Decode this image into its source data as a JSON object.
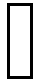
{
  "shape": {
    "type": "rectangle-outline",
    "border_color": "#000000",
    "fill_color": "#ffffff"
  },
  "background_color": "#ffffff"
}
